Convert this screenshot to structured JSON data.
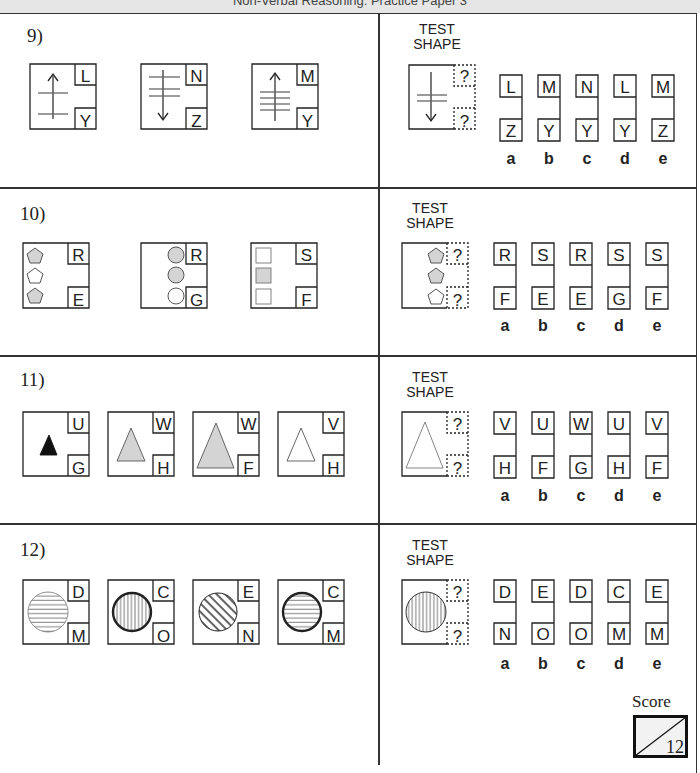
{
  "header": {
    "title": "Non-Verbal Reasoning: Practice Paper 3"
  },
  "test_shape_label": [
    "TEST",
    "SHAPE"
  ],
  "option_letters": [
    "a",
    "b",
    "c",
    "d",
    "e"
  ],
  "questions": [
    {
      "number": "9)",
      "examples": [
        {
          "top": "L",
          "bottom": "Y",
          "arrow": "up",
          "lines": 2
        },
        {
          "top": "N",
          "bottom": "Z",
          "arrow": "down",
          "lines": 3
        },
        {
          "top": "M",
          "bottom": "Y",
          "arrow": "up",
          "lines": 4
        }
      ],
      "test": {
        "top": "?",
        "bottom": "?",
        "arrow": "down",
        "lines": 2
      },
      "options": [
        {
          "letter": "a",
          "top": "L",
          "bottom": "Z"
        },
        {
          "letter": "b",
          "top": "M",
          "bottom": "Y"
        },
        {
          "letter": "c",
          "top": "N",
          "bottom": "Y"
        },
        {
          "letter": "d",
          "top": "L",
          "bottom": "Y"
        },
        {
          "letter": "e",
          "top": "M",
          "bottom": "Z"
        }
      ]
    },
    {
      "number": "10)",
      "examples": [
        {
          "top": "R",
          "bottom": "E",
          "shape": "pentagon",
          "fills": [
            "grey",
            "white",
            "grey"
          ],
          "position": "left"
        },
        {
          "top": "R",
          "bottom": "G",
          "shape": "circle",
          "fills": [
            "grey",
            "grey",
            "white"
          ],
          "position": "right"
        },
        {
          "top": "S",
          "bottom": "F",
          "shape": "square",
          "fills": [
            "white",
            "grey",
            "white"
          ],
          "position": "left"
        }
      ],
      "test": {
        "top": "?",
        "bottom": "?",
        "shape": "pentagon",
        "fills": [
          "grey",
          "grey",
          "white"
        ],
        "position": "right"
      },
      "options": [
        {
          "letter": "a",
          "top": "R",
          "bottom": "F"
        },
        {
          "letter": "b",
          "top": "S",
          "bottom": "E"
        },
        {
          "letter": "c",
          "top": "R",
          "bottom": "E"
        },
        {
          "letter": "d",
          "top": "S",
          "bottom": "G"
        },
        {
          "letter": "e",
          "top": "S",
          "bottom": "F"
        }
      ]
    },
    {
      "number": "11)",
      "examples": [
        {
          "top": "U",
          "bottom": "G",
          "shape": "triangle",
          "size": "small",
          "fill": "black"
        },
        {
          "top": "W",
          "bottom": "H",
          "shape": "triangle",
          "size": "medium",
          "fill": "grey"
        },
        {
          "top": "W",
          "bottom": "F",
          "shape": "triangle",
          "size": "large",
          "fill": "grey"
        },
        {
          "top": "V",
          "bottom": "H",
          "shape": "triangle",
          "size": "medium",
          "fill": "white"
        }
      ],
      "test": {
        "top": "?",
        "bottom": "?",
        "shape": "triangle",
        "size": "large",
        "fill": "white"
      },
      "options": [
        {
          "letter": "a",
          "top": "V",
          "bottom": "H"
        },
        {
          "letter": "b",
          "top": "U",
          "bottom": "F"
        },
        {
          "letter": "c",
          "top": "W",
          "bottom": "G"
        },
        {
          "letter": "d",
          "top": "U",
          "bottom": "H"
        },
        {
          "letter": "e",
          "top": "V",
          "bottom": "F"
        }
      ]
    },
    {
      "number": "12)",
      "examples": [
        {
          "top": "D",
          "bottom": "M",
          "shape": "circle",
          "hatch": "horizontal",
          "outline": "thin"
        },
        {
          "top": "C",
          "bottom": "O",
          "shape": "circle",
          "hatch": "vertical",
          "outline": "thick"
        },
        {
          "top": "E",
          "bottom": "N",
          "shape": "circle",
          "hatch": "diagonal",
          "outline": "thin"
        },
        {
          "top": "C",
          "bottom": "M",
          "shape": "circle",
          "hatch": "horizontal",
          "outline": "thick"
        }
      ],
      "test": {
        "top": "?",
        "bottom": "?",
        "shape": "circle",
        "hatch": "vertical",
        "outline": "thin"
      },
      "options": [
        {
          "letter": "a",
          "top": "D",
          "bottom": "N"
        },
        {
          "letter": "b",
          "top": "E",
          "bottom": "O"
        },
        {
          "letter": "c",
          "top": "D",
          "bottom": "O"
        },
        {
          "letter": "d",
          "top": "C",
          "bottom": "M"
        },
        {
          "letter": "e",
          "top": "E",
          "bottom": "M"
        }
      ]
    }
  ],
  "score": {
    "label": "Score",
    "total": "12"
  },
  "colors": {
    "line": "#333333",
    "grey_fill": "#d4d4d4",
    "header_bg": "#e6e6e6"
  }
}
